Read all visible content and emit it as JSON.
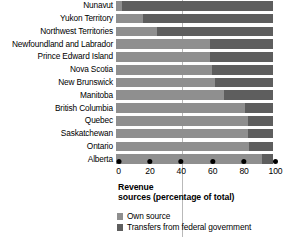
{
  "chart_data": {
    "type": "bar",
    "orientation": "horizontal",
    "stacked": true,
    "title": "Revenue sources (percentage of total)",
    "title_line1": "Revenue",
    "title_line2": "sources (percentage of total)",
    "xlabel": "",
    "ylabel": "",
    "xlim": [
      0,
      100
    ],
    "xticks": [
      0,
      20,
      40,
      60,
      80,
      100
    ],
    "xtick_labels": [
      "0",
      "20",
      "40",
      "60",
      "80",
      "100"
    ],
    "grid": false,
    "legend_position": "bottom-left",
    "categories": [
      "Nunavut",
      "Yukon Territory",
      "Northwest Territories",
      "Newfoundland and Labrador",
      "Prince Edward Island",
      "Nova Scotia",
      "New Brunswick",
      "Manitoba",
      "British Columbia",
      "Quebec",
      "Saskatchewan",
      "Ontario",
      "Alberta"
    ],
    "series": [
      {
        "name": "Own source",
        "color": "#8f8f8f",
        "values": [
          4,
          17,
          26,
          60,
          60,
          61,
          63,
          69,
          82,
          84,
          84,
          85,
          93
        ]
      },
      {
        "name": "Transfers from federal government",
        "color": "#5e5e5e",
        "values": [
          96,
          83,
          74,
          40,
          40,
          39,
          37,
          31,
          18,
          16,
          16,
          15,
          7
        ]
      }
    ],
    "colors": {
      "own_source": "#8f8f8f",
      "transfers": "#5e5e5e",
      "background": "#ffffff",
      "text": "#000000",
      "reference_line": "#b9b9b9"
    }
  },
  "legend": {
    "items": [
      {
        "label": "Own source",
        "swatch": "own"
      },
      {
        "label": "Transfers from federal government",
        "swatch": "transfer"
      }
    ]
  }
}
